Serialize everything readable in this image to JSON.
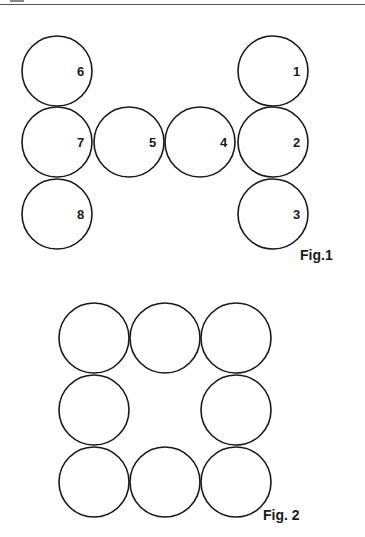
{
  "figure1": {
    "caption": "Fig.1",
    "circles": [
      {
        "label": "1",
        "col": 3,
        "row": 0
      },
      {
        "label": "2",
        "col": 3,
        "row": 1
      },
      {
        "label": "3",
        "col": 3,
        "row": 2
      },
      {
        "label": "4",
        "col": 2,
        "row": 1
      },
      {
        "label": "5",
        "col": 1,
        "row": 1
      },
      {
        "label": "6",
        "col": 0,
        "row": 0
      },
      {
        "label": "7",
        "col": 0,
        "row": 1
      },
      {
        "label": "8",
        "col": 0,
        "row": 2
      }
    ]
  },
  "figure2": {
    "caption": "Fig. 2",
    "circles": [
      {
        "col": 0,
        "row": 0
      },
      {
        "col": 1,
        "row": 0
      },
      {
        "col": 2,
        "row": 0
      },
      {
        "col": 0,
        "row": 1
      },
      {
        "col": 2,
        "row": 1
      },
      {
        "col": 0,
        "row": 2
      },
      {
        "col": 1,
        "row": 2
      },
      {
        "col": 2,
        "row": 2
      }
    ]
  }
}
